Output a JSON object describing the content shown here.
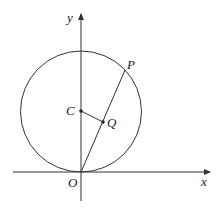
{
  "diagram": {
    "labels": {
      "y_axis": "y",
      "x_axis": "x",
      "origin": "O",
      "center": "C",
      "point_p": "P",
      "point_q": "Q"
    },
    "colors": {
      "stroke": "#333333",
      "background": "#ffffff"
    }
  }
}
